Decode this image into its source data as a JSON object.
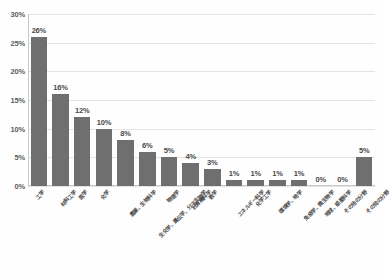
{
  "chart_data": {
    "type": "bar",
    "title": "",
    "subtitle": "",
    "xlabel": "",
    "ylabel": "",
    "ylim": [
      0,
      30
    ],
    "ytick_labels": [
      "0%",
      "5%",
      "10%",
      "15%",
      "20%",
      "25%",
      "30%"
    ],
    "ytick_values": [
      0,
      5,
      10,
      15,
      20,
      25,
      30
    ],
    "grid": true,
    "legend": false,
    "legend_position": "none",
    "bar_color": "#6f6f6f",
    "categories": [
      "工学",
      "材料工学",
      "医学",
      "化学",
      "農業、生物科学",
      "生化学、遺伝学、分子生物学",
      "物理学",
      "計算機科学",
      "数学",
      "エネルギー科学",
      "化学工学",
      "環境学、地学",
      "免疫学、微生物学",
      "地球、惑星科学",
      "その他の分野"
    ],
    "values": [
      26,
      16,
      12,
      10,
      8,
      6,
      5,
      4,
      3,
      1,
      1,
      1,
      1,
      0,
      0
    ],
    "data_labels": [
      "26%",
      "16%",
      "12%",
      "10%",
      "8%",
      "6%",
      "5%",
      "4%",
      "3%",
      "1%",
      "1%",
      "1%",
      "1%",
      "0%",
      "0%"
    ],
    "series": [
      {
        "name": "",
        "values": [
          26,
          16,
          12,
          10,
          8,
          6,
          5,
          4,
          3,
          1,
          1,
          1,
          1,
          0,
          0
        ]
      }
    ],
    "trailing_category": "その他の分野",
    "trailing_value": 5,
    "trailing_label": "5%"
  }
}
